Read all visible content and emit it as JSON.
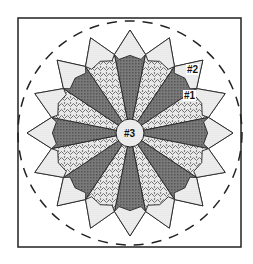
{
  "diagram": {
    "type": "quilt-block-pattern",
    "pattern": "Dresden Plate",
    "petal_count": 16,
    "labels": [
      {
        "id": "label-1",
        "text": "#1",
        "x": 183,
        "y": 90
      },
      {
        "id": "label-2",
        "text": "#2",
        "x": 186,
        "y": 64
      },
      {
        "id": "label-3",
        "text": "#3",
        "x": 124,
        "y": 128
      }
    ],
    "colors": {
      "dark_check": "#6e6e6e",
      "floral": "#c8c8c8",
      "dot_tip": "#e4e4e4",
      "line": "#222222",
      "background": "#ffffff"
    }
  }
}
